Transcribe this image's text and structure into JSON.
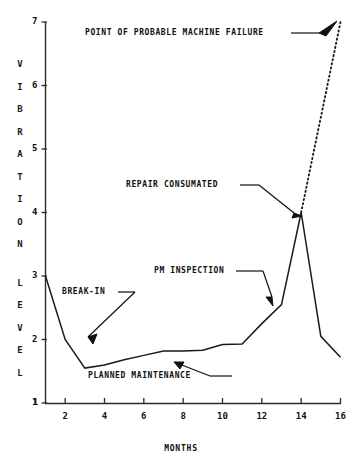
{
  "chart_data": {
    "type": "line",
    "title": "",
    "xlabel": "MONTHS",
    "ylabel": "VIBRATION LEVEL",
    "xlim": [
      1,
      16
    ],
    "ylim": [
      1,
      7
    ],
    "xticks": [
      1,
      2,
      4,
      6,
      8,
      10,
      12,
      14,
      16
    ],
    "xtick_labels": [
      "1",
      "2",
      "4",
      "6",
      "8",
      "10",
      "12",
      "14",
      "16"
    ],
    "yticks": [
      1,
      2,
      3,
      4,
      5,
      6,
      7
    ],
    "ytick_labels": [
      "1",
      "2",
      "3",
      "4",
      "5",
      "6",
      "7"
    ],
    "grid": false,
    "legend": "none",
    "series": [
      {
        "name": "measured vibration level",
        "style": "solid",
        "x": [
          1,
          2,
          3,
          4,
          5,
          6,
          7,
          8,
          9,
          10,
          11,
          12,
          13,
          14,
          15,
          16
        ],
        "values": [
          3.0,
          2.0,
          1.55,
          1.6,
          1.68,
          1.75,
          1.82,
          1.82,
          1.83,
          1.92,
          1.93,
          2.25,
          2.55,
          4.0,
          2.05,
          1.72
        ]
      },
      {
        "name": "projected failure trend",
        "style": "dotted",
        "x": [
          14,
          16
        ],
        "values": [
          4.0,
          7.0
        ]
      }
    ],
    "annotations": [
      {
        "id": "point-of-probable-machine-failure",
        "text": "POINT OF PROBABLE MACHINE FAILURE",
        "points_to_x": 16,
        "points_to_y": 7.0
      },
      {
        "id": "repair-consumated",
        "text": "REPAIR CONSUMATED",
        "points_to_x": 14,
        "points_to_y": 4.0
      },
      {
        "id": "pm-inspection",
        "text": "PM INSPECTION",
        "points_to_x": 12.7,
        "points_to_y": 2.6
      },
      {
        "id": "break-in",
        "text": "BREAK-IN",
        "points_to_x": 2.7,
        "points_to_y": 1.75
      },
      {
        "id": "planned-maintenance",
        "text": "PLANNED MAINTENANCE",
        "points_to_x": 9.2,
        "points_to_y": 1.82
      }
    ]
  },
  "axis": {
    "y_title_letters": [
      "V",
      "I",
      "B",
      "R",
      "A",
      "T",
      "I",
      "O",
      "N",
      "L",
      "E",
      "V",
      "E",
      "L"
    ],
    "x_title": "MONTHS"
  },
  "colors": {
    "line": "#1a1a1a",
    "axis": "#2b2b2b",
    "text": "#101010",
    "background": "#ffffff"
  }
}
